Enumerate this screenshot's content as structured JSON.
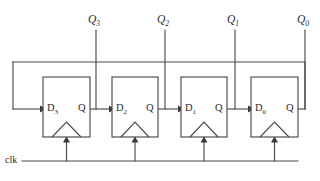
{
  "diagram": {
    "type": "digital-logic-schematic",
    "colors": {
      "background": "#ffffff",
      "wire": "#4a4a4a",
      "text": "#2b2b2b",
      "arrowhead": "#3a3a3a"
    },
    "clock": {
      "label": "clk",
      "bus_y": 161,
      "bus_x_start": 22,
      "bus_x_end": 298
    },
    "outputs": [
      {
        "name": "Q3",
        "base": "Q",
        "sub": "3",
        "x": 96
      },
      {
        "name": "Q2",
        "base": "Q",
        "sub": "2",
        "x": 165
      },
      {
        "name": "Q1",
        "base": "Q",
        "sub": "1",
        "x": 235
      },
      {
        "name": "Q0",
        "base": "Q",
        "sub": "0",
        "x": 305
      }
    ],
    "flipflops": [
      {
        "id": "ff3",
        "d_base": "D",
        "d_sub": "3",
        "q_label": "Q",
        "box": {
          "x": 43,
          "y": 77,
          "w": 47,
          "h": 60
        }
      },
      {
        "id": "ff2",
        "d_base": "D",
        "d_sub": "2",
        "q_label": "Q",
        "box": {
          "x": 112,
          "y": 77,
          "w": 46,
          "h": 60
        }
      },
      {
        "id": "ff1",
        "d_base": "D",
        "d_sub": "1",
        "q_label": "Q",
        "box": {
          "x": 181,
          "y": 77,
          "w": 46,
          "h": 60
        }
      },
      {
        "id": "ff0",
        "d_base": "D",
        "d_sub": "0",
        "q_label": "Q",
        "box": {
          "x": 251,
          "y": 77,
          "w": 47,
          "h": 60
        }
      }
    ],
    "feedback": {
      "description": "Q0 output routed back to D3 input",
      "top_y": 62,
      "left_x": 13
    }
  }
}
